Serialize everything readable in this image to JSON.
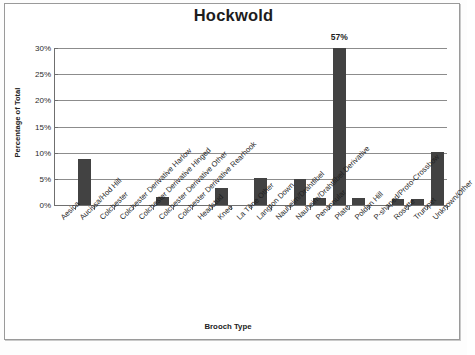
{
  "chart_data": {
    "type": "bar",
    "title": "Hockwold",
    "xlabel": "Brooch Type",
    "ylabel": "Percentage of Total",
    "ylim": [
      0,
      30
    ],
    "ytick_labels": [
      "30%",
      "25%",
      "20%",
      "15%",
      "10%",
      "5%",
      "0%"
    ],
    "ytick_values": [
      30,
      25,
      20,
      15,
      10,
      5,
      0
    ],
    "grid": true,
    "legend": "none",
    "bar_color": "#424242",
    "note": "Plate bar is clipped at the 30% axis maximum and annotated with its true value 57%",
    "categories": [
      "Aesica",
      "Aucissa/Hod Hill",
      "Colchester",
      "Colchester Derivative Harlow",
      "Colchester Derivative Hinged",
      "Colchester Derivative Other",
      "Colchester Derivative Rearhook",
      "Headstud",
      "Knee",
      "La Tène Other",
      "Langton Down",
      "Nauheim/Drahtfibel",
      "Nauheim/Drahtfibel Derivative",
      "Penannular",
      "Plate",
      "Polden Hill",
      "P-shaped/Proto-Crossbow",
      "Rosette",
      "Trumpet",
      "Unknown/Other"
    ],
    "values": [
      0,
      8.8,
      0,
      0,
      0,
      1.6,
      0,
      0,
      3.2,
      0,
      5.1,
      0,
      5.0,
      1.4,
      57,
      1.3,
      0,
      1.2,
      1.2,
      10.1
    ],
    "data_labels": [
      "",
      "",
      "",
      "",
      "",
      "",
      "",
      "",
      "",
      "",
      "",
      "",
      "",
      "",
      "57%",
      "",
      "",
      "",
      "",
      ""
    ]
  }
}
